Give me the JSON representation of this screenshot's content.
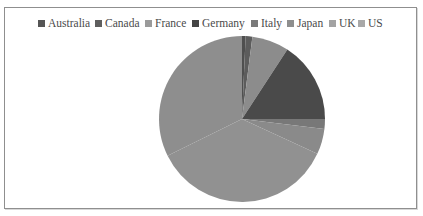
{
  "chart_data": {
    "type": "pie",
    "title": "",
    "legend_position": "top",
    "start_angle_deg": 0,
    "direction": "clockwise",
    "categories": [
      "Australia",
      "Canada",
      "France",
      "Germany",
      "Italy",
      "Japan",
      "UK",
      "US"
    ],
    "values": [
      0.7,
      1.3,
      7.2,
      15.8,
      1.9,
      5.0,
      35.8,
      32.3
    ],
    "colors": [
      "#4f4f4f",
      "#5c5c5c",
      "#8c8c8c",
      "#4a4a4a",
      "#787878",
      "#8a8a8a",
      "#919191",
      "#8e8e8e"
    ],
    "value_units": "percent (estimated)"
  },
  "legend": {
    "items": [
      {
        "label": "Australia",
        "color": "#555555"
      },
      {
        "label": "Canada",
        "color": "#5e5e5e"
      },
      {
        "label": "France",
        "color": "#9a9a9a"
      },
      {
        "label": "Germany",
        "color": "#444444"
      },
      {
        "label": "Italy",
        "color": "#7a7a7a"
      },
      {
        "label": "Japan",
        "color": "#8e8e8e"
      },
      {
        "label": "UK",
        "color": "#a3a3a3"
      },
      {
        "label": "US",
        "color": "#a8a8a8"
      }
    ]
  }
}
